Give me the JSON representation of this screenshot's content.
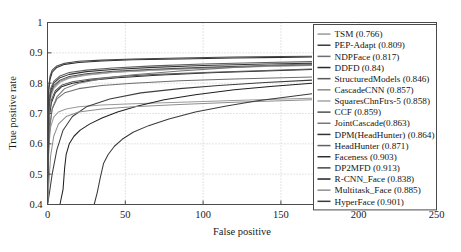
{
  "chart_data": {
    "type": "line",
    "title": "",
    "xlabel": "False positive",
    "ylabel": "True positive rate",
    "xlim": [
      0,
      250
    ],
    "ylim": [
      0.4,
      1
    ],
    "xticks": [
      0,
      50,
      100,
      150,
      200,
      250
    ],
    "xtick_labels": [
      "0",
      "50",
      "100",
      "150",
      "200",
      "250"
    ],
    "yticks": [
      0.4,
      0.5,
      0.6,
      0.7,
      0.8,
      0.9,
      1
    ],
    "ytick_labels": [
      "0.4",
      "0.5",
      "0.6",
      "0.7",
      "0.8",
      "0.9",
      "1"
    ],
    "grid": true,
    "legend_position": "right",
    "series": [
      {
        "name": "TSM (0.766)",
        "label": "TSM",
        "auc": 0.766,
        "color": "#9a9a9a",
        "points": [
          [
            0,
            0.4
          ],
          [
            0.5,
            0.52
          ],
          [
            1,
            0.6
          ],
          [
            2,
            0.655
          ],
          [
            4,
            0.688
          ],
          [
            7,
            0.705
          ],
          [
            12,
            0.715
          ],
          [
            20,
            0.722
          ],
          [
            35,
            0.728
          ],
          [
            55,
            0.732
          ],
          [
            80,
            0.736
          ],
          [
            110,
            0.741
          ],
          [
            140,
            0.746
          ],
          [
            170,
            0.75
          ]
        ]
      },
      {
        "name": "PEP-Adapt (0.809)",
        "label": "PEP-Adapt",
        "auc": 0.809,
        "color": "#3d3d3d",
        "points": [
          [
            0,
            0.4
          ],
          [
            1,
            0.43
          ],
          [
            3,
            0.5
          ],
          [
            6,
            0.58
          ],
          [
            10,
            0.645
          ],
          [
            16,
            0.69
          ],
          [
            25,
            0.722
          ],
          [
            40,
            0.748
          ],
          [
            60,
            0.768
          ],
          [
            85,
            0.782
          ],
          [
            110,
            0.792
          ],
          [
            140,
            0.802
          ],
          [
            170,
            0.81
          ]
        ]
      },
      {
        "name": "NDPFace (0.817)",
        "label": "NDPFace",
        "auc": 0.817,
        "color": "#6e6e6e",
        "points": [
          [
            0,
            0.4
          ],
          [
            0.6,
            0.58
          ],
          [
            1.5,
            0.66
          ],
          [
            3,
            0.715
          ],
          [
            6,
            0.748
          ],
          [
            11,
            0.768
          ],
          [
            20,
            0.782
          ],
          [
            35,
            0.792
          ],
          [
            55,
            0.8
          ],
          [
            85,
            0.808
          ],
          [
            120,
            0.814
          ],
          [
            170,
            0.82
          ]
        ]
      },
      {
        "name": "DDFD (0.84)",
        "label": "DDFD",
        "auc": 0.84,
        "color": "#2b2b2b",
        "points": [
          [
            0,
            0.4
          ],
          [
            0.5,
            0.6
          ],
          [
            1.2,
            0.69
          ],
          [
            2.5,
            0.735
          ],
          [
            5,
            0.768
          ],
          [
            9,
            0.788
          ],
          [
            16,
            0.8
          ],
          [
            28,
            0.81
          ],
          [
            45,
            0.818
          ],
          [
            70,
            0.826
          ],
          [
            105,
            0.834
          ],
          [
            140,
            0.84
          ],
          [
            170,
            0.845
          ]
        ]
      },
      {
        "name": "StructuredModels (0.846)",
        "label": "StructuredModels",
        "auc": 0.846,
        "color": "#595959",
        "points": [
          [
            0,
            0.4
          ],
          [
            0.5,
            0.62
          ],
          [
            1.2,
            0.7
          ],
          [
            2.5,
            0.745
          ],
          [
            5,
            0.775
          ],
          [
            9,
            0.793
          ],
          [
            16,
            0.805
          ],
          [
            28,
            0.814
          ],
          [
            45,
            0.822
          ],
          [
            70,
            0.829
          ],
          [
            105,
            0.836
          ],
          [
            140,
            0.842
          ],
          [
            170,
            0.847
          ]
        ]
      },
      {
        "name": "CascadeCNN (0.857)",
        "label": "CascadeCNN",
        "auc": 0.857,
        "color": "#8a8a8a",
        "points": [
          [
            0,
            0.4
          ],
          [
            0.4,
            0.64
          ],
          [
            1,
            0.715
          ],
          [
            2,
            0.758
          ],
          [
            4,
            0.786
          ],
          [
            8,
            0.806
          ],
          [
            14,
            0.818
          ],
          [
            25,
            0.828
          ],
          [
            42,
            0.836
          ],
          [
            68,
            0.843
          ],
          [
            100,
            0.849
          ],
          [
            140,
            0.855
          ],
          [
            170,
            0.858
          ]
        ]
      },
      {
        "name": "SquaresChnFtrs-5 (0.858)",
        "label": "SquaresChnFtrs-5",
        "auc": 0.858,
        "color": "#a5a5a5",
        "points": [
          [
            0,
            0.4
          ],
          [
            0.4,
            0.63
          ],
          [
            1,
            0.705
          ],
          [
            2,
            0.752
          ],
          [
            4,
            0.782
          ],
          [
            8,
            0.803
          ],
          [
            14,
            0.816
          ],
          [
            25,
            0.826
          ],
          [
            42,
            0.835
          ],
          [
            68,
            0.843
          ],
          [
            100,
            0.85
          ],
          [
            140,
            0.856
          ],
          [
            170,
            0.86
          ]
        ]
      },
      {
        "name": "CCF (0.859)",
        "label": "CCF",
        "auc": 0.859,
        "color": "#4f4f4f",
        "points": [
          [
            0,
            0.4
          ],
          [
            0.4,
            0.655
          ],
          [
            1,
            0.725
          ],
          [
            2,
            0.765
          ],
          [
            4,
            0.792
          ],
          [
            8,
            0.81
          ],
          [
            14,
            0.822
          ],
          [
            25,
            0.831
          ],
          [
            42,
            0.839
          ],
          [
            68,
            0.846
          ],
          [
            100,
            0.852
          ],
          [
            140,
            0.858
          ],
          [
            170,
            0.861
          ]
        ]
      },
      {
        "name": "JointCascade(0.863)",
        "label": "JointCascade",
        "auc": 0.863,
        "color": "#777777",
        "points": [
          [
            0,
            0.4
          ],
          [
            0.6,
            0.56
          ],
          [
            1.5,
            0.655
          ],
          [
            3,
            0.715
          ],
          [
            6,
            0.755
          ],
          [
            11,
            0.782
          ],
          [
            20,
            0.8
          ],
          [
            35,
            0.815
          ],
          [
            55,
            0.828
          ],
          [
            85,
            0.84
          ],
          [
            120,
            0.852
          ],
          [
            150,
            0.86
          ],
          [
            170,
            0.864
          ]
        ]
      },
      {
        "name": "DPM(HeadHunter) (0.864)",
        "label": "DPM(HeadHunter)",
        "auc": 0.864,
        "color": "#333333",
        "points": [
          [
            0,
            0.4
          ],
          [
            0.4,
            0.66
          ],
          [
            1,
            0.735
          ],
          [
            2,
            0.775
          ],
          [
            4,
            0.8
          ],
          [
            8,
            0.818
          ],
          [
            14,
            0.829
          ],
          [
            25,
            0.838
          ],
          [
            42,
            0.845
          ],
          [
            68,
            0.852
          ],
          [
            100,
            0.858
          ],
          [
            140,
            0.863
          ],
          [
            170,
            0.866
          ]
        ]
      },
      {
        "name": "HeadHunter (0.871)",
        "label": "HeadHunter",
        "auc": 0.871,
        "color": "#606060",
        "points": [
          [
            0,
            0.4
          ],
          [
            0.4,
            0.67
          ],
          [
            1,
            0.742
          ],
          [
            2,
            0.782
          ],
          [
            4,
            0.806
          ],
          [
            8,
            0.824
          ],
          [
            14,
            0.835
          ],
          [
            25,
            0.843
          ],
          [
            42,
            0.85
          ],
          [
            68,
            0.857
          ],
          [
            100,
            0.863
          ],
          [
            140,
            0.868
          ],
          [
            170,
            0.871
          ]
        ]
      },
      {
        "name": "Faceness (0.903)",
        "label": "Faceness",
        "auc": 0.903,
        "color": "#2f2f2f",
        "points": [
          [
            0,
            0.4
          ],
          [
            0.3,
            0.7
          ],
          [
            0.8,
            0.775
          ],
          [
            1.6,
            0.812
          ],
          [
            3,
            0.836
          ],
          [
            6,
            0.852
          ],
          [
            11,
            0.862
          ],
          [
            20,
            0.868
          ],
          [
            35,
            0.873
          ],
          [
            55,
            0.877
          ],
          [
            85,
            0.88
          ],
          [
            120,
            0.883
          ],
          [
            150,
            0.885
          ],
          [
            170,
            0.886
          ]
        ]
      },
      {
        "name": "DP2MFD (0.913)",
        "label": "DP2MFD",
        "auc": 0.913,
        "color": "#454545",
        "points": [
          [
            0,
            0.4
          ],
          [
            0.3,
            0.715
          ],
          [
            0.8,
            0.788
          ],
          [
            1.6,
            0.822
          ],
          [
            3,
            0.843
          ],
          [
            6,
            0.857
          ],
          [
            11,
            0.866
          ],
          [
            20,
            0.872
          ],
          [
            35,
            0.876
          ],
          [
            55,
            0.88
          ],
          [
            85,
            0.883
          ],
          [
            120,
            0.886
          ],
          [
            150,
            0.888
          ],
          [
            170,
            0.889
          ]
        ]
      },
      {
        "name": "R-CNN_Face (0.838)",
        "label": "R-CNN_Face",
        "auc": 0.838,
        "color": "#202020",
        "points": [
          [
            0,
            0.4
          ],
          [
            8,
            0.4
          ],
          [
            10,
            0.45
          ],
          [
            11,
            0.52
          ],
          [
            12,
            0.565
          ],
          [
            14,
            0.6
          ],
          [
            17,
            0.625
          ],
          [
            21,
            0.645
          ],
          [
            27,
            0.665
          ],
          [
            35,
            0.685
          ],
          [
            45,
            0.705
          ],
          [
            58,
            0.725
          ],
          [
            75,
            0.745
          ],
          [
            95,
            0.762
          ],
          [
            120,
            0.778
          ],
          [
            145,
            0.79
          ],
          [
            170,
            0.8
          ]
        ]
      },
      {
        "name": "Multitask_Face (0.885)",
        "label": "Multitask_Face",
        "auc": 0.885,
        "color": "#8f8f8f",
        "points": [
          [
            0,
            0.4
          ],
          [
            1,
            0.48
          ],
          [
            2,
            0.56
          ],
          [
            4,
            0.625
          ],
          [
            7,
            0.665
          ],
          [
            12,
            0.69
          ],
          [
            20,
            0.705
          ],
          [
            35,
            0.715
          ],
          [
            55,
            0.722
          ],
          [
            85,
            0.73
          ],
          [
            120,
            0.737
          ],
          [
            150,
            0.742
          ],
          [
            170,
            0.745
          ]
        ]
      },
      {
        "name": "HyperFace (0.901)",
        "label": "HyperFace",
        "auc": 0.901,
        "color": "#3a3a3a",
        "points": [
          [
            0,
            0.4
          ],
          [
            30,
            0.4
          ],
          [
            32,
            0.44
          ],
          [
            34,
            0.49
          ],
          [
            36,
            0.535
          ],
          [
            39,
            0.565
          ],
          [
            43,
            0.592
          ],
          [
            48,
            0.615
          ],
          [
            55,
            0.638
          ],
          [
            65,
            0.66
          ],
          [
            78,
            0.682
          ],
          [
            95,
            0.705
          ],
          [
            115,
            0.725
          ],
          [
            135,
            0.742
          ],
          [
            155,
            0.755
          ],
          [
            170,
            0.765
          ]
        ]
      }
    ]
  }
}
